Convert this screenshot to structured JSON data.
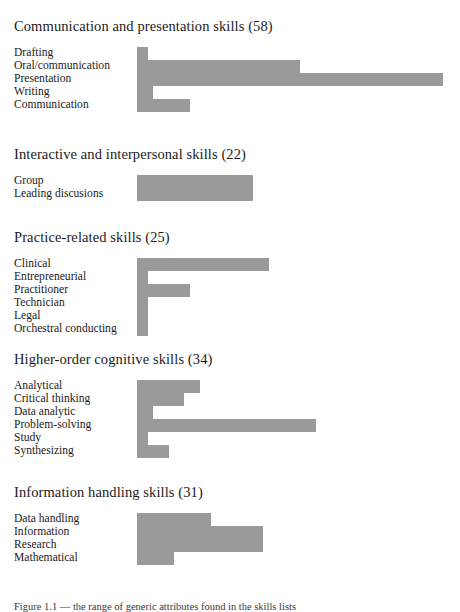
{
  "figure": {
    "caption": "Figure 1.1 — the range of generic attributes found in the skills lists",
    "bar_color": "#9a9a9a",
    "background": "#ffffff"
  },
  "chart_data": {
    "type": "bar",
    "orientation": "horizontal",
    "title": "",
    "xlabel": "",
    "ylabel": "",
    "grid": false,
    "legend": "none",
    "xlim": [
      0,
      60
    ],
    "groups": [
      {
        "title": "Communication and presentation skills (58)",
        "total": 58,
        "categories": [
          "Drafting",
          "Oral/communication",
          "Presentation",
          "Writing",
          "Communication"
        ],
        "values": [
          2,
          31,
          58,
          3,
          10
        ]
      },
      {
        "title": "Interactive and interpersonal skills (22)",
        "total": 22,
        "categories": [
          "Group",
          "Leading discusions"
        ],
        "values": [
          22,
          22
        ]
      },
      {
        "title": "Practice-related skills (25)",
        "total": 25,
        "categories": [
          "Clinical",
          "Entrepreneurial",
          "Practitioner",
          "Technician",
          "Legal",
          "Orchestral conducting"
        ],
        "values": [
          25,
          2,
          10,
          2,
          2,
          2
        ]
      },
      {
        "title": "Higher-order cognitive skills (34)",
        "total": 34,
        "categories": [
          "Analytical",
          "Critical thinking",
          "Data analytic",
          "Problem-solving",
          "Study",
          "Synthesizing"
        ],
        "values": [
          12,
          9,
          3,
          34,
          2,
          6
        ]
      },
      {
        "title": "Information handling skills (31)",
        "total": 31,
        "categories": [
          "Data handling",
          "Information",
          "Research",
          "Mathematical"
        ],
        "values": [
          14,
          24,
          24,
          7
        ]
      }
    ]
  },
  "layout": {
    "group_tops": [
      18,
      146,
      229,
      351,
      484
    ],
    "rows_tops": [
      47,
      175,
      258,
      380,
      513
    ],
    "bar_scale_px_per_unit": 5.27,
    "bar_origin_x": 137
  }
}
